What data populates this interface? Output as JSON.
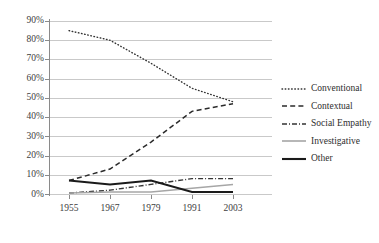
{
  "chart_data": {
    "type": "line",
    "title": "",
    "xlabel": "",
    "ylabel": "",
    "categories": [
      "1955",
      "1967",
      "1979",
      "1991",
      "2003"
    ],
    "ylim": [
      0,
      90
    ],
    "ytick_labels": [
      "0%",
      "10%",
      "20%",
      "30%",
      "40%",
      "50%",
      "60%",
      "70%",
      "80%",
      "90%"
    ],
    "ytick_values": [
      0,
      10,
      20,
      30,
      40,
      50,
      60,
      70,
      80,
      90
    ],
    "grid": true,
    "legend_position": "right",
    "series": [
      {
        "name": "Conventional",
        "style": "dotted",
        "color": "#333333",
        "values": [
          85,
          80,
          68,
          55,
          48
        ]
      },
      {
        "name": "Contextual",
        "style": "dashed",
        "color": "#2b2b2b",
        "values": [
          7,
          13,
          27,
          43,
          47
        ]
      },
      {
        "name": "Social Empathy",
        "style": "dash-dot",
        "color": "#333333",
        "values": [
          0.5,
          2,
          5,
          8,
          8
        ]
      },
      {
        "name": "Investigative",
        "style": "solid-thin",
        "color": "#a6a6a6",
        "values": [
          0.5,
          1,
          1,
          3,
          5
        ]
      },
      {
        "name": "Other",
        "style": "solid-thick",
        "color": "#1a1a1a",
        "values": [
          7,
          5,
          7,
          1,
          1
        ]
      }
    ]
  },
  "colors": {
    "gridline": "#c9c9c9",
    "axis": "#8a8a8a",
    "text": "#404040",
    "background": "#ffffff"
  }
}
